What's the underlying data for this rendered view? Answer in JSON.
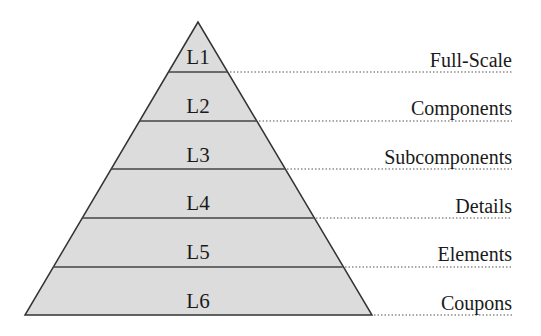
{
  "diagram": {
    "type": "pyramid",
    "fill_color": "#dcdcdc",
    "line_color": "#333333",
    "levels": [
      {
        "code": "L1",
        "label": "Full-Scale"
      },
      {
        "code": "L2",
        "label": "Components"
      },
      {
        "code": "L3",
        "label": "Subcomponents"
      },
      {
        "code": "L4",
        "label": "Details"
      },
      {
        "code": "L5",
        "label": "Elements"
      },
      {
        "code": "L6",
        "label": "Coupons"
      }
    ]
  }
}
